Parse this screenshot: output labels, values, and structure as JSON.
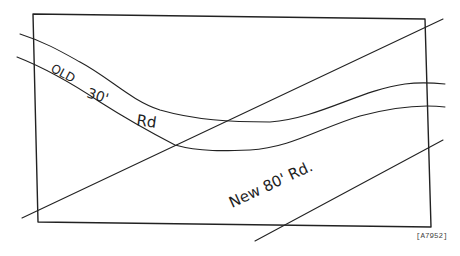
{
  "diagram": {
    "type": "road-alignment-sketch",
    "labels": {
      "old_road_word1": "OLD",
      "old_road_word2": "30'",
      "old_road_word3": "Rd",
      "new_road": "New 80' Rd.",
      "figure_ref": "[A7952]"
    },
    "elements": {
      "parcel_boundary": "rectangle",
      "old_road": "curved 30-foot road crossing parcel",
      "new_road": "straight 80-foot road crossing parcel diagonally"
    },
    "colors": {
      "ink": "#222222",
      "paper": "#ffffff"
    }
  }
}
